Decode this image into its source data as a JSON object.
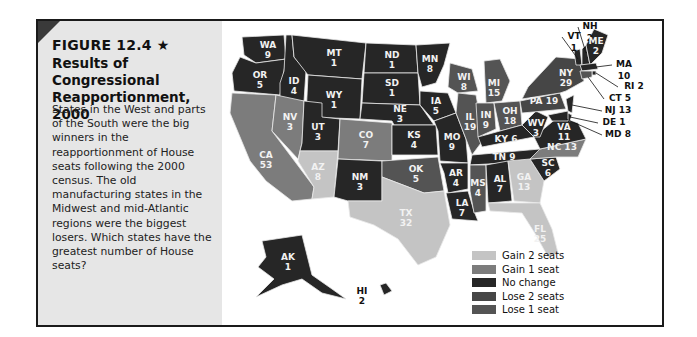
{
  "figure": {
    "label": "FIGURE 12.4 ★",
    "title": "Results of Congressional Reapportionment, 2000",
    "caption": "States in the West and parts of the South were the big winners in the reapportionment of House seats following the 2000 census. The old manufacturing states in the Midwest and mid-Atlantic regions were the biggest losers. Which states have the greatest number of House seats?"
  },
  "legend": [
    {
      "key": "gain2",
      "label": "Gain 2 seats",
      "color": "#c4c4c4"
    },
    {
      "key": "gain1",
      "label": "Gain 1 seat",
      "color": "#7c7c7c"
    },
    {
      "key": "none",
      "label": "No change",
      "color": "#262626"
    },
    {
      "key": "lose2",
      "label": "Lose 2 seats",
      "color": "#464646"
    },
    {
      "key": "lose1",
      "label": "Lose 1 seat",
      "color": "#545454"
    }
  ],
  "states": [
    {
      "abbr": "WA",
      "seats": 9,
      "change": "none"
    },
    {
      "abbr": "OR",
      "seats": 5,
      "change": "none"
    },
    {
      "abbr": "CA",
      "seats": 53,
      "change": "gain1"
    },
    {
      "abbr": "ID",
      "seats": 4,
      "change": "none"
    },
    {
      "abbr": "NV",
      "seats": 3,
      "change": "gain1"
    },
    {
      "abbr": "MT",
      "seats": 1,
      "change": "none"
    },
    {
      "abbr": "WY",
      "seats": 1,
      "change": "none"
    },
    {
      "abbr": "UT",
      "seats": 3,
      "change": "none"
    },
    {
      "abbr": "AZ",
      "seats": 8,
      "change": "gain2"
    },
    {
      "abbr": "CO",
      "seats": 7,
      "change": "gain1"
    },
    {
      "abbr": "NM",
      "seats": 3,
      "change": "none"
    },
    {
      "abbr": "ND",
      "seats": 1,
      "change": "none"
    },
    {
      "abbr": "SD",
      "seats": 1,
      "change": "none"
    },
    {
      "abbr": "NE",
      "seats": 3,
      "change": "none"
    },
    {
      "abbr": "KS",
      "seats": 4,
      "change": "none"
    },
    {
      "abbr": "OK",
      "seats": 5,
      "change": "lose1"
    },
    {
      "abbr": "TX",
      "seats": 32,
      "change": "gain2"
    },
    {
      "abbr": "MN",
      "seats": 8,
      "change": "none"
    },
    {
      "abbr": "IA",
      "seats": 5,
      "change": "none"
    },
    {
      "abbr": "MO",
      "seats": 9,
      "change": "none"
    },
    {
      "abbr": "AR",
      "seats": 4,
      "change": "none"
    },
    {
      "abbr": "LA",
      "seats": 7,
      "change": "none"
    },
    {
      "abbr": "WI",
      "seats": 8,
      "change": "lose1"
    },
    {
      "abbr": "IL",
      "seats": 19,
      "change": "lose1"
    },
    {
      "abbr": "MI",
      "seats": 15,
      "change": "lose1"
    },
    {
      "abbr": "IN",
      "seats": 9,
      "change": "lose1"
    },
    {
      "abbr": "OH",
      "seats": 18,
      "change": "lose1"
    },
    {
      "abbr": "KY",
      "seats": 6,
      "change": "none"
    },
    {
      "abbr": "TN",
      "seats": 9,
      "change": "none"
    },
    {
      "abbr": "MS",
      "seats": 4,
      "change": "lose1"
    },
    {
      "abbr": "AL",
      "seats": 7,
      "change": "none"
    },
    {
      "abbr": "GA",
      "seats": 13,
      "change": "gain2"
    },
    {
      "abbr": "FL",
      "seats": 25,
      "change": "gain2"
    },
    {
      "abbr": "SC",
      "seats": 6,
      "change": "none"
    },
    {
      "abbr": "NC",
      "seats": 13,
      "change": "gain1"
    },
    {
      "abbr": "VA",
      "seats": 11,
      "change": "none"
    },
    {
      "abbr": "WV",
      "seats": 3,
      "change": "none"
    },
    {
      "abbr": "PA",
      "seats": 19,
      "change": "lose2"
    },
    {
      "abbr": "NY",
      "seats": 29,
      "change": "lose2"
    },
    {
      "abbr": "VT",
      "seats": 1,
      "change": "none"
    },
    {
      "abbr": "NH",
      "seats": 2,
      "change": "none"
    },
    {
      "abbr": "ME",
      "seats": 2,
      "change": "none"
    },
    {
      "abbr": "MA",
      "seats": 10,
      "change": "none"
    },
    {
      "abbr": "RI",
      "seats": 2,
      "change": "none"
    },
    {
      "abbr": "CT",
      "seats": 5,
      "change": "lose1"
    },
    {
      "abbr": "NJ",
      "seats": 13,
      "change": "none"
    },
    {
      "abbr": "DE",
      "seats": 1,
      "change": "none"
    },
    {
      "abbr": "MD",
      "seats": 8,
      "change": "none"
    },
    {
      "abbr": "AK",
      "seats": 1,
      "change": "none"
    },
    {
      "abbr": "HI",
      "seats": 2,
      "change": "none"
    }
  ]
}
